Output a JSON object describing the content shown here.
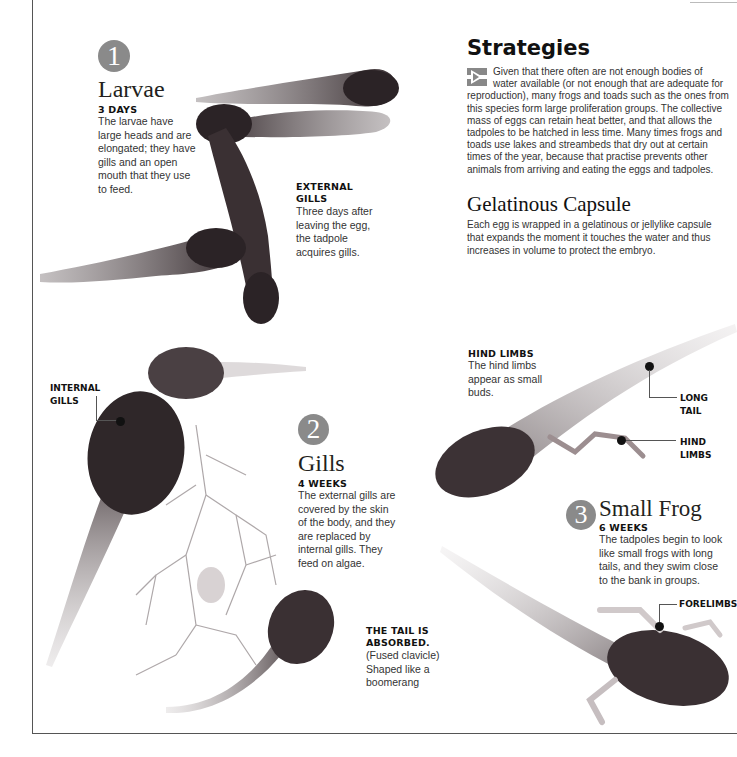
{
  "strategies": {
    "title": "Strategies",
    "icon": "arrow-bullet-icon",
    "body": "Given that there often are not enough bodies of water available (or not enough that are adequate for reproduction), many frogs and toads such as the ones from this species form large proliferation groups. The collective mass of eggs can retain heat better, and that allows the tadpoles to be hatched in less time. Many times frogs and toads use lakes and streambeds that dry out at certain times of the year, because that practise prevents other animals from arriving and eating the eggs and tadpoles."
  },
  "capsule": {
    "title": "Gelatinous Capsule",
    "body": "Each egg is wrapped in a gelatinous or jellylike capsule that expands the moment it touches the water and thus increases in volume to protect the embryo."
  },
  "stages": [
    {
      "number": "1",
      "title": "Larvae",
      "time": "3 DAYS",
      "body": "The larvae have large heads and are elongated; they have gills and an open mouth that they use to feed."
    },
    {
      "number": "2",
      "title": "Gills",
      "time": "4 WEEKS",
      "body": "The external gills are covered by the skin of the body, and they are replaced by internal gills. They feed on algae."
    },
    {
      "number": "3",
      "title": "Small Frog",
      "time": "6 WEEKS",
      "body": "The tadpoles begin to look like small frogs with long tails, and they swim close to the bank in groups."
    }
  ],
  "annotations": {
    "external_gills": {
      "title": "EXTERNAL GILLS",
      "body": "Three days after leaving the egg, the tadpole acquires gills."
    },
    "internal_gills": {
      "title": "INTERNAL GILLS"
    },
    "tail_absorbed": {
      "title": "THE TAIL IS ABSORBED.",
      "body": "(Fused clavicle) Shaped like a boomerang"
    },
    "hind_limbs_note": {
      "title": "HIND LIMBS",
      "body": "The hind limbs appear as small buds."
    },
    "long_tail": {
      "title": "LONG TAIL"
    },
    "hind_limbs": {
      "title": "HIND LIMBS"
    },
    "forelimbs": {
      "title": "FORELIMBS"
    }
  },
  "colors": {
    "number_circle": "#8a8a8a",
    "tadpole_dark": "#2b2326",
    "text": "#231f20"
  }
}
